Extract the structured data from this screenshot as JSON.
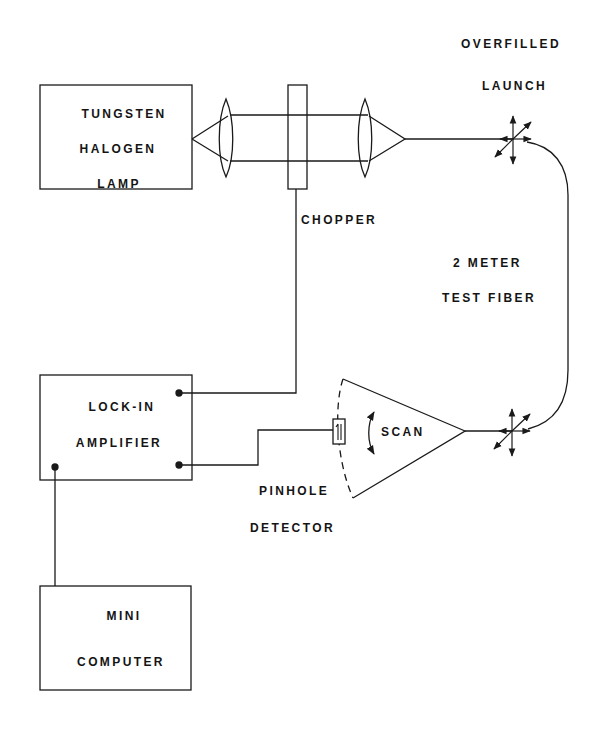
{
  "colors": {
    "ink": "#1a1a1a",
    "background": "#ffffff"
  },
  "blocks": {
    "lamp": {
      "lines": [
        "TUNGSTEN",
        "HALOGEN",
        "LAMP"
      ]
    },
    "lockin": {
      "lines": [
        "LOCK-IN",
        "AMPLIFIER"
      ]
    },
    "computer": {
      "lines": [
        "MINI",
        "COMPUTER"
      ]
    }
  },
  "labels": {
    "chopper": "CHOPPER",
    "launch": [
      "OVERFILLED",
      "LAUNCH"
    ],
    "fiber": [
      "2 METER",
      "TEST FIBER"
    ],
    "scan": "SCAN",
    "detector": [
      "PINHOLE",
      "DETECTOR"
    ]
  },
  "icons": {
    "lens": "biconvex-lens",
    "launch_arrows": "multi-direction-arrows",
    "scan_arrow": "curved-double-arrow",
    "detector": "pinhole-detector"
  }
}
